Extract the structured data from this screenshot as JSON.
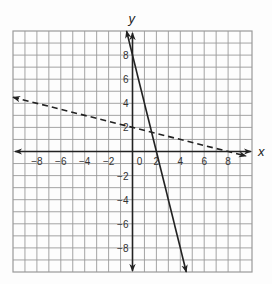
{
  "chart_data": {
    "type": "line",
    "title": "",
    "xlabel": "x",
    "ylabel": "y",
    "xlim": [
      -10,
      10
    ],
    "ylim": [
      -10,
      10
    ],
    "grid": true,
    "grid_step": 1,
    "x_ticks": [
      -8,
      -6,
      -4,
      -2,
      0,
      2,
      4,
      6,
      8
    ],
    "y_ticks": [
      8,
      6,
      4,
      2,
      -2,
      -4,
      -6,
      -8
    ],
    "x_tick_labels": [
      "−8",
      "−6",
      "−4",
      "−2",
      "0",
      "2",
      "4",
      "6",
      "8"
    ],
    "y_tick_labels": [
      "8",
      "6",
      "4",
      "2",
      "−2",
      "−4",
      "−6",
      "−8"
    ],
    "series": [
      {
        "name": "solid line",
        "style": "solid",
        "equation": "y = -4x + 8",
        "slope": -4,
        "intercept": 8,
        "x": [
          -0.5,
          4.5
        ],
        "y": [
          10,
          -10
        ]
      },
      {
        "name": "dashed line",
        "style": "dashed",
        "equation": "y = -0.25x + 2",
        "slope": -0.25,
        "intercept": 2,
        "x": [
          -10,
          9.5
        ],
        "y": [
          4.5,
          -0.375
        ]
      }
    ],
    "intersection": {
      "x": 1.6,
      "y": 1.6
    },
    "legend": "none"
  },
  "colors": {
    "grid": "#9a9a9a",
    "axis": "#222222",
    "line": "#222222",
    "background": "#fdfdfd"
  }
}
